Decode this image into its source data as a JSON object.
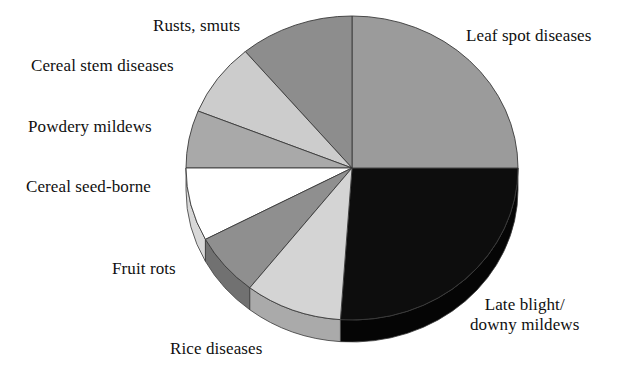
{
  "chart_data": {
    "type": "pie",
    "title": "",
    "subtitle": "",
    "xlabel": "",
    "ylabel": "",
    "legend_position": "none",
    "grid": false,
    "labels_position": "outside-callout",
    "categories": [
      "Leaf spot diseases",
      "Late blight/ downy mildews",
      "Rice diseases",
      "Fruit rots",
      "Cereal seed-borne",
      "Powdery mildews",
      "Cereal stem diseases",
      "Rusts, smuts"
    ],
    "values": [
      26,
      25,
      11,
      8,
      8,
      8,
      7,
      7
    ],
    "slices": [
      {
        "label": "Leaf spot diseases",
        "value": 26,
        "color": "#0d0d0d",
        "side_color": "#050505",
        "start_angle_deg": 0,
        "end_angle_deg": 94
      },
      {
        "label": "Late blight/ downy mildews",
        "value": 25,
        "color": "#9b9b9b",
        "side_color": "#7a7a7a",
        "start_angle_deg": 270,
        "end_angle_deg": 360
      },
      {
        "label": "Rice diseases",
        "value": 11,
        "color": "#8d8d8d",
        "side_color": "#6d6d6d",
        "start_angle_deg": 230,
        "end_angle_deg": 270
      },
      {
        "label": "Fruit rots",
        "value": 8,
        "color": "#cccccc",
        "side_color": "#a2a2a2",
        "start_angle_deg": 202,
        "end_angle_deg": 230
      },
      {
        "label": "Cereal seed-borne",
        "value": 8,
        "color": "#a9a9a9",
        "side_color": "#878787",
        "start_angle_deg": 180,
        "end_angle_deg": 202
      },
      {
        "label": "Powdery mildews",
        "value": 8,
        "color": "#ffffff",
        "side_color": "#d8d8d8",
        "start_angle_deg": 152,
        "end_angle_deg": 180
      },
      {
        "label": "Cereal stem diseases",
        "value": 7,
        "color": "#8f8f8f",
        "side_color": "#717171",
        "start_angle_deg": 128,
        "end_angle_deg": 152
      },
      {
        "label": "Rusts, smuts",
        "value": 7,
        "color": "#d4d4d4",
        "side_color": "#aaaaaa",
        "start_angle_deg": 94,
        "end_angle_deg": 128
      }
    ]
  },
  "labels": {
    "leaf_spot": "Leaf spot diseases",
    "late_blight": "Late blight/\ndowny mildews",
    "rice_diseases": "Rice diseases",
    "fruit_rots": "Fruit rots",
    "cereal_seed_borne": "Cereal seed-borne",
    "powdery_mildews": "Powdery mildews",
    "cereal_stem_diseases": "Cereal stem diseases",
    "rusts_smuts": "Rusts, smuts"
  },
  "geometry": {
    "center_x": 352,
    "center_y": 168,
    "radius_x": 166,
    "radius_y": 152,
    "depth": 22
  },
  "colors": {
    "background": "#ffffff",
    "text": "#101010",
    "outline": "#3a3a3a"
  }
}
